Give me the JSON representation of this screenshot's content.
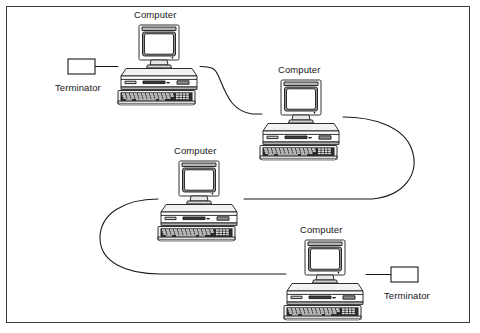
{
  "diagram": {
    "frame": {
      "x": 6,
      "y": 6,
      "width": 464,
      "height": 317,
      "stroke": "#3a3a3a",
      "stroke_width": 1,
      "fill": "#ffffff"
    },
    "colors": {
      "outline": "#1a1a1a",
      "cable": "#1a1a1a",
      "case_face": "#ffffff",
      "case_shade": "#d9d9d9",
      "screen": "#ffffff",
      "screen_bezel": "#9a9a9a",
      "keyboard_dark": "#2b2b2b",
      "key_light": "#e2e2e2",
      "label_text": "#171717"
    },
    "nodes": [
      {
        "id": "computer-1",
        "type": "computer",
        "label": "Computer",
        "label_x": 134,
        "label_y": 9,
        "icon_x": 114,
        "icon_y": 24,
        "icon_w": 90,
        "icon_h": 84
      },
      {
        "id": "computer-2",
        "type": "computer",
        "label": "Computer",
        "label_x": 278,
        "label_y": 64,
        "icon_x": 256,
        "icon_y": 79,
        "icon_w": 90,
        "icon_h": 84
      },
      {
        "id": "computer-3",
        "type": "computer",
        "label": "Computer",
        "label_x": 174,
        "label_y": 145,
        "icon_x": 154,
        "icon_y": 160,
        "icon_w": 90,
        "icon_h": 84
      },
      {
        "id": "computer-4",
        "type": "computer",
        "label": "Computer",
        "label_x": 300,
        "label_y": 224,
        "icon_x": 280,
        "icon_y": 239,
        "icon_w": 90,
        "icon_h": 84
      },
      {
        "id": "terminator-left",
        "type": "terminator",
        "label": "Terminator",
        "label_x": 55,
        "label_y": 82,
        "box_x": 68,
        "box_y": 59,
        "box_w": 27,
        "box_h": 15
      },
      {
        "id": "terminator-right",
        "type": "terminator",
        "label": "Terminator",
        "label_x": 384,
        "label_y": 290,
        "box_x": 391,
        "box_y": 267,
        "box_w": 27,
        "box_h": 15
      }
    ],
    "cables": [
      {
        "id": "cable-terminator-left-to-computer-1",
        "from": "terminator-left",
        "to": "computer-1",
        "path": "M 95 66.5 L 118 66.5"
      },
      {
        "id": "cable-computer-1-to-computer-2",
        "from": "computer-1",
        "to": "computer-2",
        "path": "M 200 66.5 C 216 66.5 216 70 221 82 C 228 99 234 111 252 114 L 262 114"
      },
      {
        "id": "cable-computer-2-to-computer-3",
        "from": "computer-2",
        "to": "computer-3",
        "path": "M 343 117 C 372 117 404 126 412 150 C 420 174 404 196 372 199 L 244 199"
      },
      {
        "id": "cable-computer-3-to-computer-4",
        "from": "computer-3",
        "to": "computer-4",
        "path": "M 158 199 C 124 199 100 214 100 238 C 100 262 126 274 160 274 L 286 274"
      },
      {
        "id": "cable-computer-4-to-terminator-right",
        "from": "computer-4",
        "to": "terminator-right",
        "path": "M 366 274.5 L 391 274.5"
      }
    ]
  }
}
